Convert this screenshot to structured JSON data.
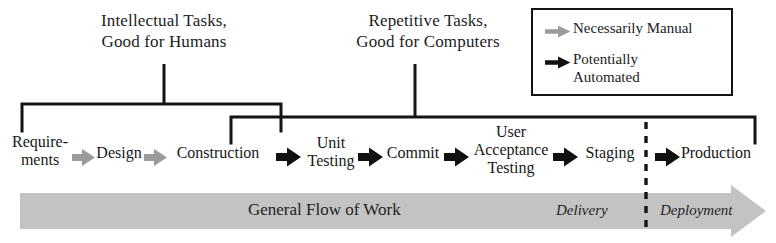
{
  "diagram": {
    "headings": [
      {
        "id": "intellectual",
        "line1": "Intellectual Tasks,",
        "line2": "Good for Humans"
      },
      {
        "id": "repetitive",
        "line1": "Repetitive Tasks,",
        "line2": "Good for Computers"
      }
    ],
    "legend": {
      "items": [
        {
          "icon": "gray-arrow-icon",
          "label": "Necessarily Manual",
          "line2": "",
          "color": "#9a9a9a"
        },
        {
          "icon": "black-arrow-icon",
          "label": "Potentially",
          "line2": "Automated",
          "color": "#111111"
        }
      ]
    },
    "nodes": [
      {
        "id": "requirements",
        "line1": "Require-",
        "line2": "ments"
      },
      {
        "id": "design",
        "line1": "Design",
        "line2": ""
      },
      {
        "id": "construction",
        "line1": "Construction",
        "line2": ""
      },
      {
        "id": "unit-testing",
        "line1": "Unit",
        "line2": "Testing"
      },
      {
        "id": "commit",
        "line1": "Commit",
        "line2": ""
      },
      {
        "id": "user-acceptance-testing",
        "line1": "User",
        "line2": "Acceptance",
        "line3": "Testing"
      },
      {
        "id": "staging",
        "line1": "Staging",
        "line2": ""
      },
      {
        "id": "production",
        "line1": "Production",
        "line2": ""
      }
    ],
    "arrows": [
      {
        "from": "requirements",
        "to": "design",
        "style": "gray"
      },
      {
        "from": "design",
        "to": "construction",
        "style": "gray"
      },
      {
        "from": "construction",
        "to": "unit-testing",
        "style": "black"
      },
      {
        "from": "unit-testing",
        "to": "commit",
        "style": "black"
      },
      {
        "from": "commit",
        "to": "user-acceptance-testing",
        "style": "black"
      },
      {
        "from": "user-acceptance-testing",
        "to": "staging",
        "style": "black"
      },
      {
        "from": "staging",
        "to": "production",
        "style": "black"
      }
    ],
    "banner": {
      "title": "General Flow of Work",
      "delivery": "Delivery",
      "deployment": "Deployment",
      "fill": "#c3c3c3"
    },
    "divider": {
      "name": "delivery-deployment-divider",
      "style": "dashed"
    },
    "colors": {
      "ink": "#141414",
      "gray_arrow": "#9a9a9a",
      "banner_gray": "#c3c3c3"
    }
  }
}
